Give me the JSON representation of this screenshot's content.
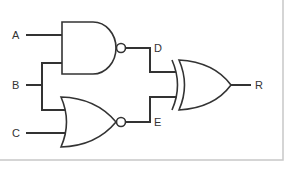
{
  "diagram": {
    "type": "logic-circuit",
    "inputs": [
      {
        "id": "A",
        "label": "A"
      },
      {
        "id": "B",
        "label": "B"
      },
      {
        "id": "C",
        "label": "C"
      }
    ],
    "intermediate": [
      {
        "id": "D",
        "label": "D"
      },
      {
        "id": "E",
        "label": "E"
      }
    ],
    "output": {
      "id": "R",
      "label": "R"
    },
    "gates": [
      {
        "id": "g1",
        "type": "NAND",
        "inputs": [
          "A",
          "B"
        ],
        "output": "D"
      },
      {
        "id": "g2",
        "type": "NOR",
        "inputs": [
          "B",
          "C"
        ],
        "output": "E"
      },
      {
        "id": "g3",
        "type": "XOR",
        "inputs": [
          "D",
          "E"
        ],
        "output": "R"
      }
    ]
  },
  "colors": {
    "line": "#333333",
    "border": "#c8c8c8",
    "background": "#ffffff"
  }
}
